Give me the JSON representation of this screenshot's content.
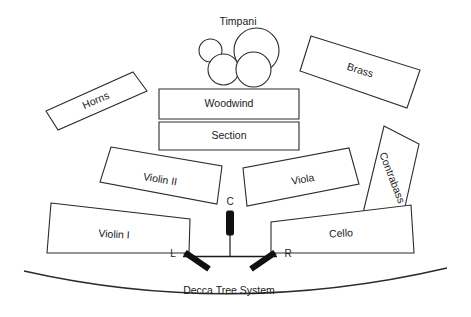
{
  "diagram": {
    "title": "Decca Tree System",
    "sections": [
      {
        "id": "timpani",
        "label": "Timpani"
      },
      {
        "id": "woodwind",
        "label": "Woodwind"
      },
      {
        "id": "section",
        "label": "Section"
      },
      {
        "id": "horns",
        "label": "Horns"
      },
      {
        "id": "brass",
        "label": "Brass"
      },
      {
        "id": "contrabass",
        "label": "Contrabass"
      },
      {
        "id": "violin-2",
        "label": "Violin II"
      },
      {
        "id": "viola",
        "label": "Viola"
      },
      {
        "id": "violin-1",
        "label": "Violin I"
      },
      {
        "id": "cello",
        "label": "Cello"
      }
    ],
    "microphones": [
      {
        "id": "mic-center",
        "label": "C"
      },
      {
        "id": "mic-left",
        "label": "L"
      },
      {
        "id": "mic-right",
        "label": "R"
      }
    ],
    "colors": {
      "outline": "#2b2b2b",
      "text": "#1a1a1a",
      "mic": "#101010",
      "background": "#ffffff"
    }
  }
}
